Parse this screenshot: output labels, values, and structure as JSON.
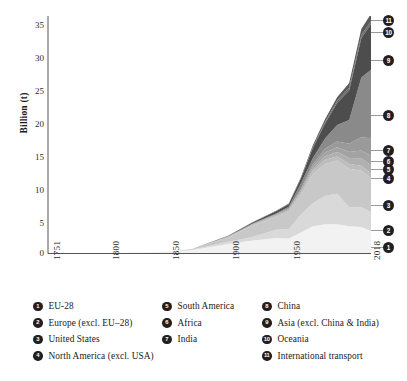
{
  "chart_data": {
    "type": "area",
    "title": "",
    "xlabel": "",
    "ylabel": "Billion (t)",
    "xlim": [
      1751,
      2018
    ],
    "ylim": [
      0,
      35
    ],
    "grid": false,
    "stacked": true,
    "legend_position": "bottom",
    "y_ticks": [
      "0",
      "5",
      "10",
      "15",
      "20",
      "25",
      "30",
      "35"
    ],
    "y_tick_values": [
      0,
      5,
      10,
      15,
      20,
      25,
      30,
      35
    ],
    "x_ticks": [
      "1751",
      "1800",
      "1850",
      "1900",
      "1950",
      "2018"
    ],
    "x_tick_values": [
      1751,
      1800,
      1850,
      1900,
      1950,
      2018
    ],
    "x": [
      1751,
      1800,
      1850,
      1870,
      1900,
      1920,
      1940,
      1950,
      1960,
      1970,
      1980,
      1990,
      2000,
      2010,
      2018
    ],
    "series": [
      {
        "name": "EU-28",
        "number": "1",
        "color": "#f2f2f2",
        "values": [
          0.01,
          0.03,
          0.22,
          0.5,
          1.4,
          1.9,
          2.3,
          2.2,
          3.1,
          4.0,
          4.3,
          4.3,
          4.0,
          3.9,
          3.3
        ],
        "end_value": 3.3
      },
      {
        "name": "Europe (excl. EU-28)",
        "number": "2",
        "color": "#d9d9d9",
        "values": [
          0.0,
          0.0,
          0.02,
          0.05,
          0.35,
          0.55,
          1.2,
          1.4,
          2.6,
          3.4,
          4.2,
          4.5,
          2.8,
          2.9,
          2.8
        ],
        "end_value": 2.8
      },
      {
        "name": "United States",
        "number": "3",
        "color": "#c8c8c8",
        "values": [
          0.0,
          0.0,
          0.02,
          0.1,
          0.66,
          1.6,
          1.9,
          2.5,
          2.9,
          4.3,
          4.7,
          4.9,
          5.7,
          5.4,
          5.0
        ],
        "end_value": 5.0
      },
      {
        "name": "North America (excl. USA)",
        "number": "4",
        "color": "#bdbdbd",
        "values": [
          0.0,
          0.0,
          0.0,
          0.01,
          0.05,
          0.12,
          0.16,
          0.2,
          0.28,
          0.45,
          0.6,
          0.58,
          0.7,
          0.74,
          0.72
        ],
        "end_value": 0.72
      },
      {
        "name": "South America",
        "number": "5",
        "color": "#b0b0b0",
        "values": [
          0.0,
          0.0,
          0.0,
          0.0,
          0.02,
          0.05,
          0.09,
          0.12,
          0.2,
          0.33,
          0.55,
          0.66,
          0.88,
          1.1,
          1.2
        ],
        "end_value": 1.2
      },
      {
        "name": "Africa",
        "number": "6",
        "color": "#a3a3a3",
        "values": [
          0.0,
          0.0,
          0.0,
          0.0,
          0.02,
          0.05,
          0.09,
          0.12,
          0.2,
          0.35,
          0.55,
          0.7,
          0.88,
          1.15,
          1.35
        ],
        "end_value": 1.35
      },
      {
        "name": "India",
        "number": "7",
        "color": "#9a9a9a",
        "values": [
          0.0,
          0.0,
          0.0,
          0.0,
          0.03,
          0.06,
          0.09,
          0.13,
          0.22,
          0.35,
          0.55,
          0.88,
          1.2,
          1.95,
          2.6
        ],
        "end_value": 2.6
      },
      {
        "name": "China",
        "number": "8",
        "color": "#8a8a8a",
        "values": [
          0.0,
          0.0,
          0.0,
          0.0,
          0.02,
          0.08,
          0.12,
          0.22,
          0.8,
          0.9,
          1.5,
          2.4,
          3.5,
          8.8,
          10.1
        ],
        "end_value": 10.1
      },
      {
        "name": "Asia (excl. China & India)",
        "number": "9",
        "color": "#4d4d4d",
        "values": [
          0.0,
          0.0,
          0.0,
          0.0,
          0.05,
          0.15,
          0.3,
          0.35,
          0.7,
          1.5,
          2.2,
          3.3,
          4.4,
          5.8,
          6.7
        ],
        "end_value": 6.7
      },
      {
        "name": "Oceania",
        "number": "10",
        "color": "#6e6e6e",
        "values": [
          0.0,
          0.0,
          0.0,
          0.0,
          0.01,
          0.02,
          0.03,
          0.04,
          0.07,
          0.14,
          0.22,
          0.3,
          0.4,
          0.46,
          0.45
        ],
        "end_value": 0.45
      },
      {
        "name": "International transport",
        "number": "11",
        "color": "#5a5a5a",
        "values": [
          0.0,
          0.0,
          0.0,
          0.0,
          0.02,
          0.04,
          0.06,
          0.08,
          0.14,
          0.26,
          0.4,
          0.5,
          0.65,
          0.9,
          1.1
        ],
        "end_value": 1.1
      }
    ],
    "end_markers": [
      {
        "number": "1",
        "y_px": 247
      },
      {
        "number": "2",
        "y_px": 230
      },
      {
        "number": "3",
        "y_px": 205
      },
      {
        "number": "4",
        "y_px": 178
      },
      {
        "number": "5",
        "y_px": 169
      },
      {
        "number": "6",
        "y_px": 161
      },
      {
        "number": "7",
        "y_px": 150
      },
      {
        "number": "8",
        "y_px": 115
      },
      {
        "number": "9",
        "y_px": 60
      },
      {
        "number": "10",
        "y_px": 32
      },
      {
        "number": "11",
        "y_px": 20
      }
    ]
  },
  "legend": {
    "columns": [
      {
        "items": [
          {
            "number": "1",
            "label": "EU-28"
          },
          {
            "number": "2",
            "label": "Europe (excl. EU–28)"
          },
          {
            "number": "3",
            "label": "United States"
          },
          {
            "number": "4",
            "label": "North America (excl. USA)"
          }
        ]
      },
      {
        "items": [
          {
            "number": "5",
            "label": "South America"
          },
          {
            "number": "6",
            "label": "Africa"
          },
          {
            "number": "7",
            "label": "India"
          }
        ]
      },
      {
        "items": [
          {
            "number": "8",
            "label": "China"
          },
          {
            "number": "9",
            "label": "Asia (excl. China & India)"
          },
          {
            "number": "10",
            "label": "Oceania"
          },
          {
            "number": "11",
            "label": "International transport"
          }
        ]
      }
    ]
  },
  "colors": {
    "axis": "#555555",
    "text": "#1a1a1a",
    "badge": "#231f20",
    "plot_bg": "#ffffff"
  }
}
